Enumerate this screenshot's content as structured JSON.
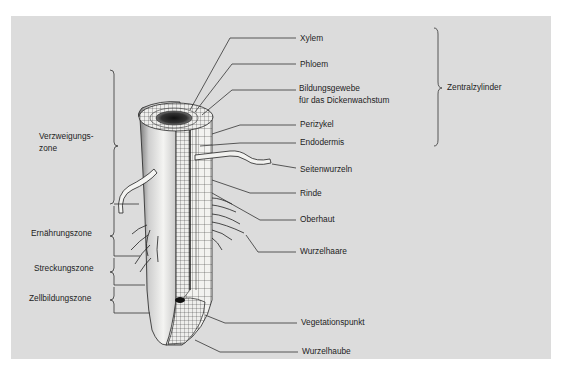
{
  "diagram": {
    "right_labels": [
      {
        "id": "xylem",
        "text": "Xylem",
        "x": 300,
        "y": 34
      },
      {
        "id": "phloem",
        "text": "Phloem",
        "x": 300,
        "y": 59
      },
      {
        "id": "bildungsgewebe",
        "line1": "Bildungsgewebe",
        "line2": "für das Dickenwachstum",
        "x": 299,
        "y": 81
      },
      {
        "id": "perizykel",
        "text": "Perizykel",
        "x": 300,
        "y": 111
      },
      {
        "id": "endodermis",
        "text": "Endodermis",
        "x": 300,
        "y": 127
      },
      {
        "id": "seitenwurzeln",
        "text": "Seitenwurzeln",
        "x": 300,
        "y": 154
      },
      {
        "id": "rinde",
        "text": "Rinde",
        "x": 300,
        "y": 176
      },
      {
        "id": "oberhaut",
        "text": "Oberhaut",
        "x": 300,
        "y": 201
      },
      {
        "id": "wurzelhaare",
        "text": "Wurzelhaare",
        "x": 300,
        "y": 231
      },
      {
        "id": "vegetationspunkt",
        "text": "Vegetationspunkt",
        "x": 301,
        "y": 298
      },
      {
        "id": "wurzelhaube",
        "text": "Wurzelhaube",
        "x": 302,
        "y": 326
      }
    ],
    "group_label": {
      "text": "Zentralzylinder",
      "x": 447,
      "y": 78
    },
    "left_labels": [
      {
        "id": "verzweigungszone",
        "line1": "Verzweigungs-",
        "line2": "zone",
        "x": 39,
        "y": 126
      },
      {
        "id": "ernaehrungszone",
        "text": "Ernährungszone",
        "x": 31,
        "y": 212
      },
      {
        "id": "streckungszone",
        "text": "Streckungszone",
        "x": 34,
        "y": 246
      },
      {
        "id": "zellbildungszone",
        "text": "Zellbildungszone",
        "x": 29,
        "y": 274
      }
    ],
    "colors": {
      "background": "#dcdcdc",
      "page": "#ffffff",
      "ink": "#1c1c1c",
      "root_light": "#f0f0ee",
      "root_shade": "#8a8a8a"
    }
  }
}
